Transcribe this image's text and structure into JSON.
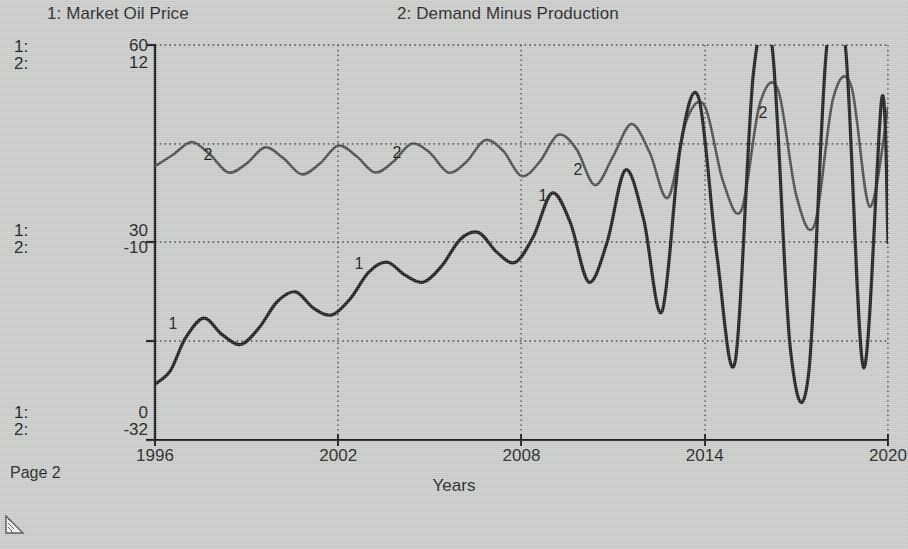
{
  "window": {
    "background_color": "#c9ccc9",
    "page_label": "Page 2",
    "corner_icon": "resize-corner-icon"
  },
  "legend": {
    "series1": "1: Market Oil Price",
    "series2": "2: Demand Minus Production"
  },
  "axis_keys": {
    "top": {
      "k1": "1:",
      "k2": "2:"
    },
    "middle": {
      "k1": "1:",
      "k2": "2:"
    },
    "bottom": {
      "k1": "1:",
      "k2": "2:"
    }
  },
  "y_ticks": {
    "top": {
      "s1": "60",
      "s2": "12"
    },
    "middle": {
      "s1": "30",
      "s2": "-10"
    },
    "bottom": {
      "s1": "0",
      "s2": "-32"
    }
  },
  "x_axis": {
    "label": "Years",
    "ticks": [
      "1996",
      "2002",
      "2008",
      "2014",
      "2020"
    ]
  },
  "curve_tags": [
    {
      "text": "1",
      "x": 173,
      "y": 324
    },
    {
      "text": "1",
      "x": 359,
      "y": 264
    },
    {
      "text": "1",
      "x": 543,
      "y": 196
    },
    {
      "text": "2",
      "x": 208,
      "y": 155
    },
    {
      "text": "2",
      "x": 397,
      "y": 153
    },
    {
      "text": "2",
      "x": 578,
      "y": 170
    },
    {
      "text": "2",
      "x": 763,
      "y": 113
    }
  ],
  "colors": {
    "series1": "#1a1a1a",
    "series2": "#4a4a4a",
    "grid": "#3c3c3c",
    "axis": "#1a1a1a",
    "background": "#c9ccc9"
  },
  "chart_data": {
    "type": "line",
    "xlabel": "Years",
    "ylabel": "",
    "grid": true,
    "legend_position": "top",
    "xlim": [
      1996,
      2020
    ],
    "x_ticks": [
      1996,
      2002,
      2008,
      2014,
      2020
    ],
    "axes": [
      {
        "id": 1,
        "name": "Market Oil Price",
        "ticks": [
          0,
          30,
          60
        ],
        "ylim": [
          0,
          60
        ]
      },
      {
        "id": 2,
        "name": "Demand Minus Production",
        "ticks": [
          -32,
          -10,
          12
        ],
        "ylim": [
          -32,
          12
        ]
      }
    ],
    "series": [
      {
        "name": "Market Oil Price",
        "axis": 1,
        "color": "#1a1a1a",
        "note": "Rising oscillation; amplitude grows after 2008 and peaks clip above 60 from 2013 onward",
        "x": [
          1996.0,
          1996.5,
          1997.0,
          1997.6,
          1998.2,
          1998.8,
          1999.4,
          2000.0,
          2000.6,
          2001.2,
          2001.8,
          2002.4,
          2003.0,
          2003.6,
          2004.2,
          2004.8,
          2005.4,
          2006.0,
          2006.6,
          2007.2,
          2007.8,
          2008.4,
          2009.0,
          2009.6,
          2010.2,
          2010.8,
          2011.4,
          2012.0,
          2012.6,
          2013.2,
          2013.8,
          2014.4,
          2015.0,
          2015.6,
          2016.2,
          2016.8,
          2017.4,
          2018.0,
          2018.6,
          2019.2,
          2019.8,
          2020.0
        ],
        "y": [
          8.5,
          10.5,
          15.5,
          18.5,
          16.0,
          14.5,
          17.0,
          21.0,
          22.5,
          20.0,
          19.0,
          21.5,
          25.5,
          27.0,
          25.0,
          24.0,
          26.5,
          30.5,
          31.5,
          28.5,
          27.0,
          31.0,
          37.5,
          33.0,
          24.0,
          30.0,
          41.0,
          33.5,
          19.5,
          44.5,
          52.0,
          28.0,
          12.0,
          56.0,
          60.0,
          14.0,
          10.0,
          60.0,
          60.0,
          11.0,
          52.0,
          30.0
        ]
      },
      {
        "name": "Demand Minus Production",
        "axis": 2,
        "color": "#4a4a4a",
        "note": "Oscillates near -2 early with small amplitude; amplitude grows steadily after 2008",
        "x": [
          1996.0,
          1996.6,
          1997.2,
          1997.8,
          1998.4,
          1999.0,
          1999.6,
          2000.2,
          2000.8,
          2001.4,
          2002.0,
          2002.6,
          2003.2,
          2003.8,
          2004.4,
          2005.0,
          2005.6,
          2006.2,
          2006.8,
          2007.4,
          2008.0,
          2008.6,
          2009.2,
          2009.8,
          2010.4,
          2011.0,
          2011.6,
          2012.2,
          2012.8,
          2013.4,
          2014.0,
          2014.6,
          2015.2,
          2015.8,
          2016.4,
          2017.0,
          2017.6,
          2018.2,
          2018.8,
          2019.4,
          2020.0
        ],
        "y": [
          -1.5,
          -0.2,
          1.2,
          -0.2,
          -2.2,
          -1.2,
          0.6,
          -0.6,
          -2.4,
          -1.2,
          0.8,
          -0.4,
          -2.2,
          -1.0,
          1.0,
          0.0,
          -2.2,
          -1.0,
          1.4,
          0.2,
          -2.6,
          -1.0,
          2.0,
          0.4,
          -3.6,
          -0.4,
          3.2,
          0.0,
          -5.0,
          3.6,
          5.2,
          -3.2,
          -6.4,
          5.4,
          7.0,
          -4.8,
          -8.0,
          6.0,
          7.4,
          -6.0,
          5.0
        ]
      }
    ]
  }
}
